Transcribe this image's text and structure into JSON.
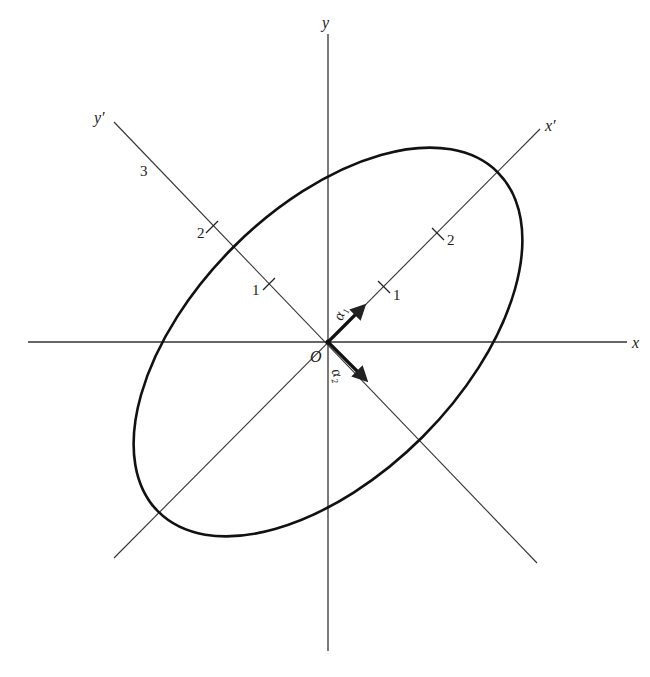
{
  "figure": {
    "type": "diagram",
    "colors": {
      "ink": "#222222",
      "background": "#ffffff"
    }
  },
  "axes": {
    "x_label": "x",
    "y_label": "y",
    "x_prime_label": "x′",
    "y_prime_label": "y′",
    "origin_label": "O"
  },
  "ticks": {
    "x_prime": [
      "1",
      "2"
    ],
    "y_prime": [
      "1",
      "2",
      "3"
    ]
  },
  "vectors": {
    "alpha1": {
      "label": "α₁",
      "direction": "x'"
    },
    "alpha2": {
      "label": "α₂",
      "direction": "-y'"
    }
  },
  "ellipse": {
    "center": "O",
    "semi_axis_y_prime": 3,
    "semi_axis_x_prime": 1.7,
    "rotation_deg": 45
  }
}
